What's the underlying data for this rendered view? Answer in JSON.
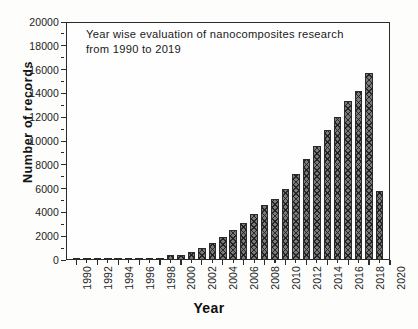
{
  "chart_data": {
    "type": "bar",
    "title": "Year wise evaluation of nanocomposites research from 1990 to 2019",
    "title_line1": "Year wise evaluation of nanocomposites research",
    "title_line2": "from 1990 to 2019",
    "xlabel": "Year",
    "ylabel": "Number of records",
    "ylim": [
      0,
      20000
    ],
    "xlim": [
      1989,
      2020
    ],
    "ytick_labels": [
      "0",
      "2000",
      "4000",
      "6000",
      "8000",
      "10000",
      "12000",
      "14000",
      "16000",
      "18000",
      "20000"
    ],
    "ytick_values": [
      0,
      2000,
      4000,
      6000,
      8000,
      10000,
      12000,
      14000,
      16000,
      18000,
      20000
    ],
    "xtick_labels": [
      "1990",
      "1992",
      "1994",
      "1996",
      "1998",
      "2000",
      "2002",
      "2004",
      "2006",
      "2008",
      "2010",
      "2012",
      "2014",
      "2016",
      "2018",
      "2020"
    ],
    "xtick_values": [
      1990,
      1992,
      1994,
      1996,
      1998,
      2000,
      2002,
      2004,
      2006,
      2008,
      2010,
      2012,
      2014,
      2016,
      2018,
      2020
    ],
    "grid": false,
    "legend": false,
    "bar_color": "#7a7a7a",
    "bar_edge_color": "#2a2a2a",
    "bar_pattern": "cross-hatch",
    "categories": [
      1990,
      1991,
      1992,
      1993,
      1994,
      1995,
      1996,
      1997,
      1998,
      1999,
      2000,
      2001,
      2002,
      2003,
      2004,
      2005,
      2006,
      2007,
      2008,
      2009,
      2010,
      2011,
      2012,
      2013,
      2014,
      2015,
      2016,
      2017,
      2018,
      2019
    ],
    "values": [
      20,
      25,
      30,
      35,
      45,
      55,
      70,
      90,
      120,
      380,
      400,
      680,
      1000,
      1430,
      1900,
      2500,
      3120,
      3830,
      4600,
      5150,
      6000,
      7250,
      8480,
      9600,
      10950,
      12000,
      13330,
      14230,
      15700,
      5800
    ]
  }
}
